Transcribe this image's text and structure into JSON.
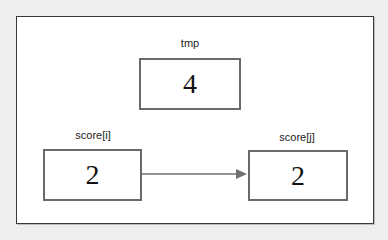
{
  "diagram": {
    "type": "variable-swap-step",
    "variables": [
      {
        "id": "tmp",
        "label": "tmp",
        "value": "4"
      },
      {
        "id": "score_i",
        "label": "score[i]",
        "value": "2"
      },
      {
        "id": "score_j",
        "label": "score[j]",
        "value": "2"
      }
    ],
    "edges": [
      {
        "from": "score_i",
        "to": "score_j",
        "style": "solid-arrow"
      }
    ],
    "colors": {
      "background": "#eeeeee",
      "frame_fill": "#ffffff",
      "frame_border": "#3a3a3a",
      "box_border": "#6a6a6a",
      "arrow": "#707070",
      "text": "#222222"
    }
  }
}
